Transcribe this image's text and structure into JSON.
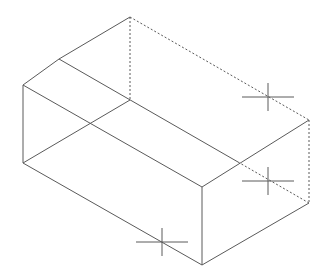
{
  "diagram": {
    "type": "isometric wireframe box",
    "stroke_color": "#5a5a5a",
    "background": "#ffffff",
    "solid_edges": [
      {
        "id": "top-left-edge-a",
        "x1": 23,
        "y1": 85,
        "x2": 59,
        "y2": 59
      },
      {
        "id": "top-left-edge-b",
        "x1": 59,
        "y1": 59,
        "x2": 130,
        "y2": 17
      },
      {
        "id": "front-top-edge",
        "x1": 23,
        "y1": 85,
        "x2": 202,
        "y2": 187
      },
      {
        "id": "ridge-edge",
        "x1": 59,
        "y1": 59,
        "x2": 238,
        "y2": 162
      },
      {
        "id": "left-vertical-edge",
        "x1": 23,
        "y1": 85,
        "x2": 23,
        "y2": 163
      },
      {
        "id": "front-bottom-edge",
        "x1": 23,
        "y1": 163,
        "x2": 202,
        "y2": 265
      },
      {
        "id": "bottom-left-back-edge",
        "x1": 23,
        "y1": 163,
        "x2": 130,
        "y2": 100
      },
      {
        "id": "front-vertical-edge",
        "x1": 202,
        "y1": 187,
        "x2": 202,
        "y2": 265
      },
      {
        "id": "right-top-edge",
        "x1": 202,
        "y1": 187,
        "x2": 309,
        "y2": 120
      },
      {
        "id": "right-bottom-edge",
        "x1": 202,
        "y1": 265,
        "x2": 309,
        "y2": 203
      }
    ],
    "hidden_edges": [
      {
        "id": "back-top-edge",
        "x1": 130,
        "y1": 17,
        "x2": 309,
        "y2": 120
      },
      {
        "id": "back-vertical-edge",
        "x1": 130,
        "y1": 17,
        "x2": 130,
        "y2": 100
      },
      {
        "id": "right-back-vertical-edge",
        "x1": 309,
        "y1": 120,
        "x2": 309,
        "y2": 203
      },
      {
        "id": "ridge-hidden-edge",
        "x1": 238,
        "y1": 162,
        "x2": 309,
        "y2": 203
      }
    ],
    "crosshairs": [
      {
        "id": "crosshair-upper-right",
        "cx": 268,
        "cy": 97,
        "half_w": 26,
        "half_h": 14
      },
      {
        "id": "crosshair-right",
        "cx": 268,
        "cy": 181,
        "half_w": 26,
        "half_h": 14
      },
      {
        "id": "crosshair-bottom",
        "cx": 162,
        "cy": 242,
        "half_w": 26,
        "half_h": 14
      }
    ]
  }
}
